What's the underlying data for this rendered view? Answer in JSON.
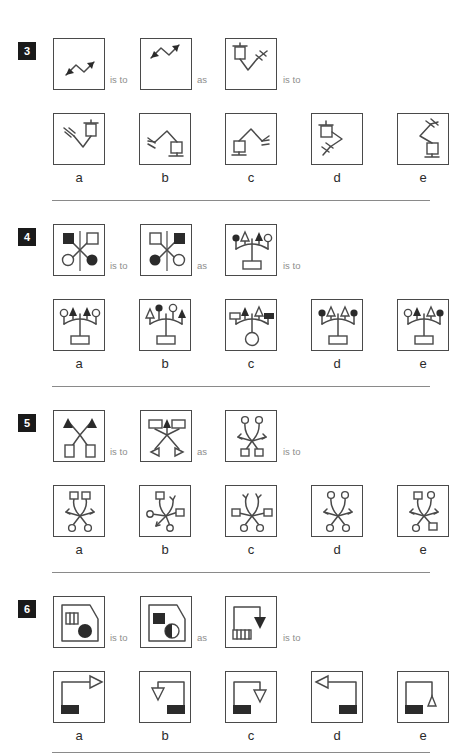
{
  "page": {
    "type": "analogy-reasoning-test",
    "background": "#ffffff",
    "ink": "#4a4a4a",
    "connector_color": "#8d8d8d",
    "badge_bg": "#1a1a1a",
    "badge_fg": "#ffffff",
    "separator_color": "#8a8a8a"
  },
  "labels": {
    "is_to": "is to",
    "as": "as",
    "option_letters": [
      "a",
      "b",
      "c",
      "d",
      "e"
    ]
  },
  "puzzles": [
    {
      "number": "3",
      "theme": "zigzag-arrows-and-robot-arms",
      "stem": [
        {
          "name": "stem-1",
          "desc": "zigzag double-headed arrow, lower-left"
        },
        {
          "name": "stem-2",
          "desc": "zigzag double-headed arrow, upper-right"
        },
        {
          "name": "stem-3",
          "desc": "robot arm, box top-left, fork right"
        }
      ],
      "options": [
        {
          "letter": "a",
          "desc": "robot arm, fork left, box top-right"
        },
        {
          "letter": "b",
          "desc": "robot arm, fork left low, box bottom-right"
        },
        {
          "letter": "c",
          "desc": "robot arm, box bottom-left, fork right"
        },
        {
          "letter": "d",
          "desc": "robot arm, box top-left, fork bottom"
        },
        {
          "letter": "e",
          "desc": "robot arm, fork top-right, box bottom-right"
        }
      ]
    },
    {
      "number": "4",
      "theme": "crossed-markers-and-candelabra",
      "stem": [
        {
          "name": "stem-1",
          "desc": "X cross: filled square TL, open square TR, open circle BL, filled circle BR"
        },
        {
          "name": "stem-2",
          "desc": "X cross: open square TL, filled square TR, filled circle BL, open circle BR"
        },
        {
          "name": "stem-3",
          "desc": "candelabra: filled circle, open arrow, filled arrow, open circle; rectangle base"
        }
      ],
      "options": [
        {
          "letter": "a",
          "desc": "candelabra: open circle, filled arrow, filled arrow, open circle; rectangle base"
        },
        {
          "letter": "b",
          "desc": "candelabra: open arrow, filled circle, open circle, filled arrow; rectangle base"
        },
        {
          "letter": "c",
          "desc": "candelabra: open flag, filled arrow, open arrow, filled flag; circle base"
        },
        {
          "letter": "d",
          "desc": "candelabra: filled circle, open arrow, open arrow, filled circle; rectangle base"
        },
        {
          "letter": "e",
          "desc": "candelabra: open circle, filled arrow, open arrow, filled circle; rectangle base"
        }
      ]
    },
    {
      "number": "5",
      "theme": "crossed-arrows-and-spider",
      "stem": [
        {
          "name": "stem-1",
          "desc": "X with filled arrows up, open rectangles down"
        },
        {
          "name": "stem-2",
          "desc": "X with rectangles up, open arrows down"
        },
        {
          "name": "stem-3",
          "desc": "spider: two circles up, arrows out, two squares down"
        }
      ],
      "options": [
        {
          "letter": "a",
          "desc": "spider: two squares up, arrows out, two circles down"
        },
        {
          "letter": "b",
          "desc": "spider: square up, arrow up, circle left, square right, arrow and circle down"
        },
        {
          "letter": "c",
          "desc": "spider: two arrows up, squares sides, two circles down"
        },
        {
          "letter": "d",
          "desc": "spider: two circles up, arrows out, circles down"
        },
        {
          "letter": "e",
          "desc": "spider: square and circle up, arrows out, circle and square down"
        }
      ]
    },
    {
      "number": "6",
      "theme": "house-shapes-and-arrow-boxes",
      "stem": [
        {
          "name": "stem-1",
          "desc": "pentagon with striped square and filled circle"
        },
        {
          "name": "stem-2",
          "desc": "pentagon with filled square and half-filled circle"
        },
        {
          "name": "stem-3",
          "desc": "bracket path with filled down arrow, striped bar bottom-left"
        }
      ],
      "options": [
        {
          "letter": "a",
          "desc": "bracket path with open right arrow top, filled bar bottom-left"
        },
        {
          "letter": "b",
          "desc": "bracket path with open down arrow left, filled bar bottom-right"
        },
        {
          "letter": "c",
          "desc": "bracket path with open down arrow right, filled bar bottom-left"
        },
        {
          "letter": "d",
          "desc": "bracket path with open left arrow top, filled bar bottom-right"
        },
        {
          "letter": "e",
          "desc": "bracket path with open up triangle right, filled bar bottom-left"
        }
      ]
    }
  ]
}
